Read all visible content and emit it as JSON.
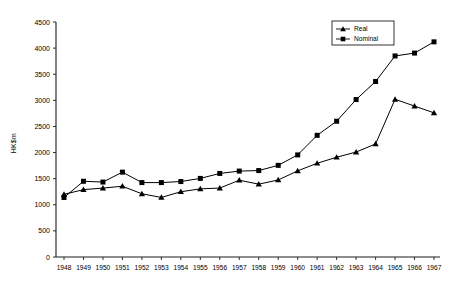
{
  "chart_data": {
    "type": "line",
    "title": "",
    "xlabel": "",
    "ylabel": "HK$m",
    "ylim": [
      0,
      4500
    ],
    "ytick_step": 500,
    "yticks": [
      0,
      500,
      1000,
      1500,
      2000,
      2500,
      3000,
      3500,
      4000,
      4500
    ],
    "grid": false,
    "legend_position": "top-right",
    "x": [
      1948,
      1949,
      1950,
      1951,
      1952,
      1953,
      1954,
      1955,
      1956,
      1957,
      1958,
      1959,
      1960,
      1961,
      1962,
      1963,
      1964,
      1965,
      1966,
      1967
    ],
    "categories": [
      "1948",
      "1949",
      "1950",
      "1951",
      "1952",
      "1953",
      "1954",
      "1955",
      "1956",
      "1957",
      "1958",
      "1959",
      "1960",
      "1961",
      "1962",
      "1963",
      "1964",
      "1965",
      "1966",
      "1967"
    ],
    "series": [
      {
        "name": "Real",
        "marker": "triangle",
        "color": "#000000",
        "values": [
          1200,
          1290,
          1320,
          1355,
          1210,
          1140,
          1250,
          1305,
          1320,
          1470,
          1395,
          1475,
          1650,
          1795,
          1910,
          2010,
          2165,
          3020,
          2890,
          2760
        ]
      },
      {
        "name": "Nominal",
        "marker": "square",
        "color": "#000000",
        "values": [
          1140,
          1450,
          1435,
          1625,
          1425,
          1425,
          1445,
          1505,
          1600,
          1645,
          1655,
          1755,
          1955,
          2330,
          2600,
          3015,
          3360,
          3850,
          3905,
          4120
        ]
      }
    ]
  },
  "legend": {
    "entries": [
      {
        "label": "Real",
        "marker": "triangle"
      },
      {
        "label": "Nominal",
        "marker": "square"
      }
    ]
  },
  "axis": {
    "y_title": "HK$m"
  }
}
